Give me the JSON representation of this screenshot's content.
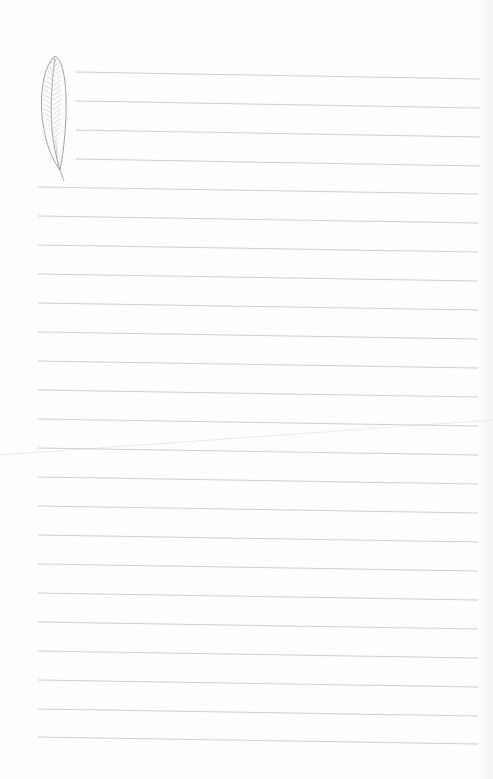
{
  "page": {
    "width": 493,
    "height": 779,
    "background": "#fefefe",
    "line_color": "#c9c9c9",
    "fold_color": "#e6e6e6"
  },
  "short_lines": {
    "x_start": 76,
    "x_end": 480,
    "slope_px": 7,
    "y": [
      72,
      101,
      130,
      159
    ]
  },
  "full_lines": {
    "x_start": 38,
    "x_end": 478,
    "slope_px": 7,
    "y": [
      187,
      216,
      245,
      274,
      303,
      332,
      361,
      390,
      419,
      448,
      477,
      506,
      535,
      564,
      593,
      622,
      651,
      680,
      709,
      737
    ]
  },
  "feather": {
    "icon": "feather-icon",
    "stroke_color": "#8a8a8a",
    "hatch_color": "#b0b0b0"
  }
}
